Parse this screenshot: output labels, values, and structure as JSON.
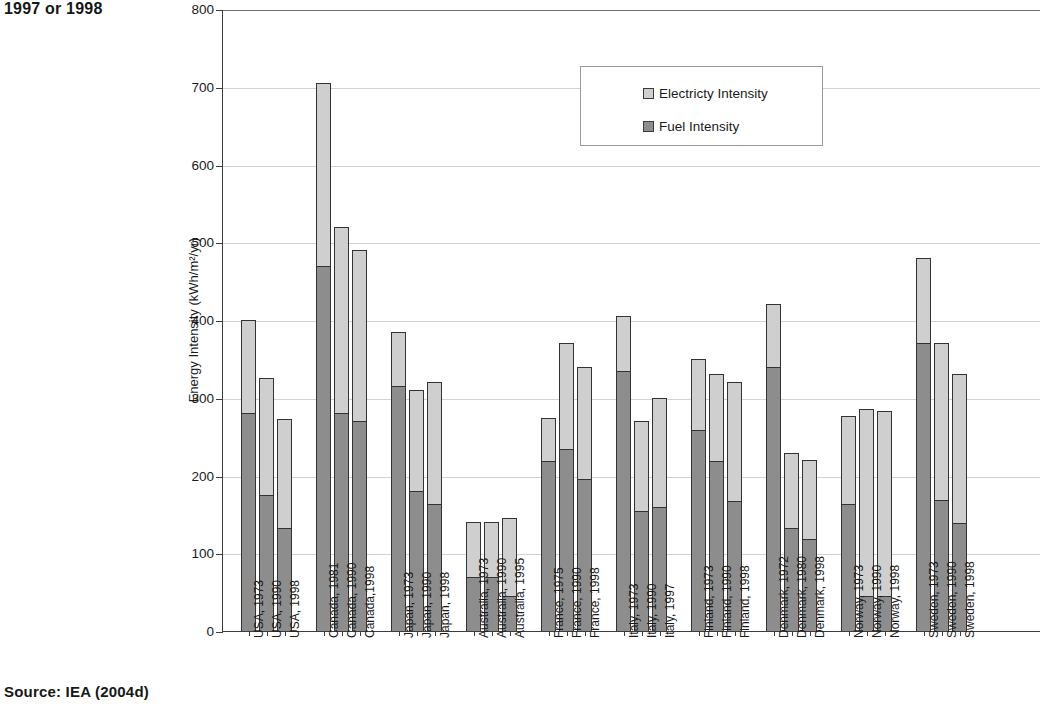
{
  "caption_fragment": "1997 or 1998",
  "source_note": "Source: IEA (2004d)",
  "legend": {
    "title": "",
    "entries": [
      {
        "label": "Electricty Intensity",
        "color": "#cfcfcf",
        "key": "electricity"
      },
      {
        "label": "Fuel Intensity",
        "color": "#8d8d8d",
        "key": "fuel"
      }
    ]
  },
  "axes": {
    "y_title": "Energy Intensity (kWh/m²/yr)",
    "y_ticks": [
      "0",
      "100",
      "200",
      "300",
      "400",
      "500",
      "600",
      "700",
      "800"
    ],
    "y_min": 0,
    "y_max": 800,
    "x_title": ""
  },
  "chart_data": {
    "type": "bar",
    "stacked": true,
    "title": "",
    "subtitle": "",
    "xlabel": "",
    "ylabel": "Energy Intensity (kWh/m²/yr)",
    "ylim": [
      0,
      800
    ],
    "ytick_step": 100,
    "grid": true,
    "legend_position": "upper-center",
    "series": [
      {
        "name": "Fuel Intensity",
        "color": "#8d8d8d",
        "values": [
          280,
          175,
          133,
          470,
          280,
          270,
          315,
          180,
          163,
          70,
          70,
          45,
          219,
          234,
          195,
          335,
          155,
          160,
          259,
          219,
          167,
          340,
          132,
          118,
          163,
          45,
          45,
          370,
          168,
          139
        ]
      },
      {
        "name": "Electricty Intensity",
        "color": "#cfcfcf",
        "values": [
          120,
          150,
          140,
          235,
          240,
          220,
          70,
          130,
          157,
          70,
          70,
          100,
          55,
          136,
          145,
          70,
          115,
          140,
          91,
          111,
          153,
          80,
          97,
          102,
          114,
          240,
          238,
          110,
          202,
          191
        ]
      }
    ],
    "totals": [
      400,
      325,
      273,
      705,
      520,
      490,
      385,
      310,
      320,
      140,
      140,
      145,
      274,
      370,
      340,
      405,
      270,
      300,
      350,
      330,
      320,
      420,
      229,
      220,
      277,
      285,
      283,
      480,
      370,
      330
    ],
    "categories": [
      "USA, 1973",
      "USA, 1990",
      "USA, 1998",
      "Canada, 1981",
      "Canada, 1990",
      "Canada,1998",
      "Japan, 1973",
      "Japan, 1990",
      "Japan, 1998",
      "Australia, 1973",
      "Australia, 1990",
      "Australia, 1995",
      "France, 1975",
      "France, 1990",
      "France, 1998",
      "Italy, 1973",
      "Italy, 1990",
      "Italy, 1997",
      "Finland, 1973",
      "Finland, 1990",
      "Finland, 1998",
      "Denmark, 1972",
      "Denmark, 1980",
      "Denmark, 1998",
      "Norway, 1973",
      "Norway, 1990",
      "Norway, 1998",
      "Sweden, 1973",
      "Sweden, 1990",
      "Sweden, 1998"
    ],
    "groups": [
      {
        "country": "USA",
        "years": [
          "1973",
          "1990",
          "1998"
        ]
      },
      {
        "country": "Canada",
        "years": [
          "1981",
          "1990",
          "1998"
        ]
      },
      {
        "country": "Japan",
        "years": [
          "1973",
          "1990",
          "1998"
        ]
      },
      {
        "country": "Australia",
        "years": [
          "1973",
          "1990",
          "1995"
        ]
      },
      {
        "country": "France",
        "years": [
          "1975",
          "1990",
          "1998"
        ]
      },
      {
        "country": "Italy",
        "years": [
          "1973",
          "1990",
          "1997"
        ]
      },
      {
        "country": "Finland",
        "years": [
          "1973",
          "1990",
          "1998"
        ]
      },
      {
        "country": "Denmark",
        "years": [
          "1972",
          "1980",
          "1998"
        ]
      },
      {
        "country": "Norway",
        "years": [
          "1973",
          "1990",
          "1998"
        ]
      },
      {
        "country": "Sweden",
        "years": [
          "1973",
          "1990",
          "1998"
        ]
      }
    ]
  },
  "colors": {
    "electricity": "#cfcfcf",
    "fuel": "#8d8d8d",
    "axis": "#3c3c3c",
    "grid": "#d2d2d2",
    "text": "#1a1a1a"
  }
}
